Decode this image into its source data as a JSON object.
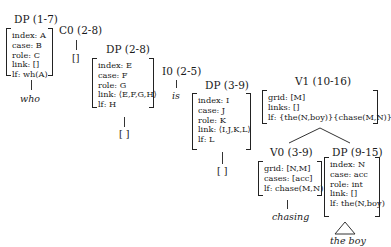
{
  "nodes": {
    "dp1": {
      "label": "DP (1-7)",
      "features": [
        "index: A",
        "case: B",
        "role: C",
        "link: []",
        "lf: wh(A)"
      ],
      "leaf": "who"
    },
    "c0": {
      "label": "C0 (2-8)",
      "leaf": "[]"
    },
    "dp2": {
      "label": "DP (2-8)",
      "features": [
        "index: E",
        "case: F",
        "role: G",
        "link: ⟨E,F,G,H⟩",
        "lf: H"
      ],
      "leaf": "[ ]"
    },
    "i0": {
      "label": "I0 (2-5)",
      "leaf": "is"
    },
    "dp3": {
      "label": "DP (3-9)",
      "features": [
        "index: I",
        "case: J",
        "role: K",
        "link: ⟨I,J,K,L⟩",
        "lf: L"
      ],
      "leaf": "[ ]"
    },
    "v1": {
      "label": "V1 (10-16)",
      "features": [
        "grid: [M]",
        "links: []",
        "lf: {the(N,boy)}{chase(M,N)}"
      ]
    },
    "v0": {
      "label": "V0 (3-9)",
      "features": [
        "grid: [N,M]",
        "cases: [acc]",
        "lf: chase(M,N)"
      ],
      "leaf": "chasing"
    },
    "dp4": {
      "label": "DP (9-15)",
      "features": [
        "index: N",
        "case: acc",
        "role: int",
        "link: []",
        "lf: the(N,boy)"
      ],
      "leaf": "the boy"
    }
  }
}
